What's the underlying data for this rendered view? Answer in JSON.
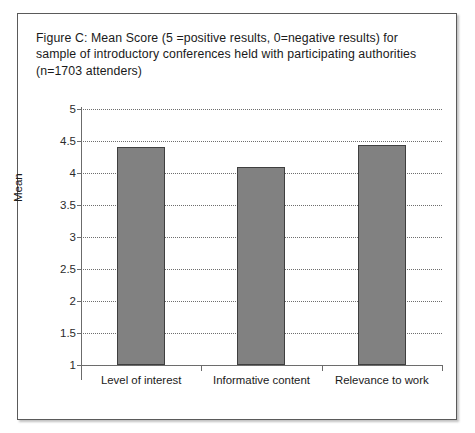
{
  "figure": {
    "caption": "Figure C: Mean Score (5 =positive results, 0=negative results) for sample of introductory conferences held with participating authorities (n=1703 attenders)"
  },
  "chart_data": {
    "type": "bar",
    "title": "Figure C: Mean Score (5 =positive results, 0=negative results) for sample of introductory conferences held with participating authorities (n=1703 attenders)",
    "xlabel": "",
    "ylabel": "Mean",
    "categories": [
      "Level of interest",
      "Informative content",
      "Relevance to work"
    ],
    "values": [
      4.4,
      4.1,
      4.43
    ],
    "ylim": [
      1,
      5
    ],
    "ytick_labels": [
      "5",
      "4.5",
      "4",
      "3.5",
      "3",
      "2.5",
      "2",
      "1.5",
      "1"
    ],
    "ytick_values": [
      5,
      4.5,
      4,
      3.5,
      3,
      2.5,
      2,
      1.5,
      1
    ],
    "grid": true,
    "grid_style": "dotted",
    "legend": "none",
    "bar_color": "#818181",
    "bar_edge_color": "#3f3f3f",
    "axis_color": "#6b6b6b",
    "n": 1703
  }
}
